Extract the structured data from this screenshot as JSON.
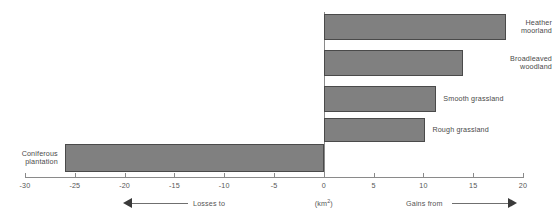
{
  "chart_data": {
    "type": "bar",
    "orientation": "horizontal",
    "title": "",
    "xlabel": "(km2)",
    "ylabel": "",
    "xlim": [
      -30,
      20
    ],
    "xticks": [
      -30,
      -25,
      -20,
      -15,
      -10,
      -5,
      0,
      5,
      10,
      15,
      20
    ],
    "xtick_labels": [
      "-30",
      "-25",
      "-20",
      "-15",
      "-10",
      "-5",
      "0",
      "5",
      "10",
      "15",
      "20"
    ],
    "grid": false,
    "legend": false,
    "categories": [
      "Heather moorland",
      "Broadleaved woodland",
      "Smooth grassland",
      "Rough grassland",
      "Coniferous plantation"
    ],
    "values": [
      18.3,
      14.0,
      11.3,
      10.2,
      -26.0
    ],
    "bar_color": "#808080",
    "bar_edge_color": "#4a4a4a",
    "annotations": {
      "left_direction": "Losses to",
      "right_direction": "Gains from",
      "unit": "(km",
      "unit_exponent": "2",
      "unit_close": ")"
    }
  },
  "bars": [
    {
      "label_line1": "Heather",
      "label_line2": "moorland",
      "label_align": "far-right",
      "value": 18.3
    },
    {
      "label_line1": "Broadleaved",
      "label_line2": "woodland",
      "label_align": "far-right",
      "value": 14.0
    },
    {
      "label_line1": "Smooth grassland",
      "label_line2": "",
      "label_align": "right-of",
      "value": 11.3
    },
    {
      "label_line1": "Rough grassland",
      "label_line2": "",
      "label_align": "right-of",
      "value": 10.2
    },
    {
      "label_line1": "Coniferous",
      "label_line2": "plantation",
      "label_align": "left-of",
      "value": -26.0
    }
  ],
  "axis": {
    "ticks": [
      "-30",
      "-25",
      "-20",
      "-15",
      "-10",
      "-5",
      "0",
      "5",
      "10",
      "15",
      "20"
    ]
  },
  "footer": {
    "losses_label": "Losses to",
    "gains_label": "Gains from",
    "unit_label": "(km",
    "unit_sup": "2",
    "unit_tail": ")"
  }
}
